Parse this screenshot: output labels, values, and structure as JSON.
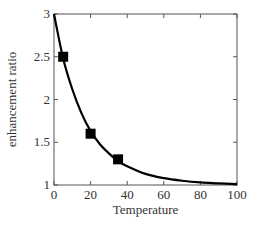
{
  "chart_data": {
    "type": "line",
    "title": "",
    "xlabel": "Temperature",
    "ylabel": "enhancement ratio",
    "xlim": [
      0,
      100
    ],
    "ylim": [
      1,
      3
    ],
    "x_ticks": [
      0,
      20,
      40,
      60,
      80,
      100
    ],
    "y_ticks": [
      1,
      1.5,
      2,
      2.5,
      3
    ],
    "x_tick_labels": [
      "0",
      "20",
      "40",
      "60",
      "80",
      "100"
    ],
    "y_tick_labels": [
      "1",
      "1.5",
      "2",
      "2.5",
      "3"
    ],
    "grid": false,
    "legend": null,
    "series": [
      {
        "name": "fit curve",
        "type": "line",
        "color": "#000000",
        "x": [
          0,
          5,
          10,
          15,
          20,
          25,
          30,
          35,
          40,
          50,
          60,
          70,
          80,
          90,
          100
        ],
        "values": [
          3.0,
          2.48,
          2.12,
          1.84,
          1.63,
          1.48,
          1.37,
          1.28,
          1.22,
          1.13,
          1.08,
          1.05,
          1.03,
          1.02,
          1.01
        ]
      },
      {
        "name": "measured",
        "type": "scatter",
        "marker": "square",
        "color": "#000000",
        "x": [
          5,
          20,
          35
        ],
        "values": [
          2.5,
          1.6,
          1.3
        ]
      }
    ]
  }
}
